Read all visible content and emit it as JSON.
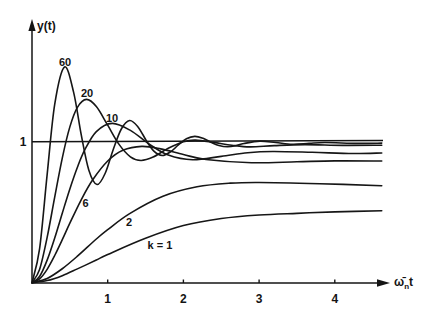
{
  "figure": {
    "y_axis_label": "y(t)",
    "x_axis_label": {
      "base": "ω̄",
      "sub": "n",
      "tail": "t"
    },
    "reference_label": "1"
  },
  "chart_data": {
    "type": "line",
    "title": "",
    "xlabel": "ω̄ₙt",
    "ylabel": "y(t)",
    "x_ticks": [
      "1",
      "2",
      "3",
      "4"
    ],
    "y_ticks": [
      "1"
    ],
    "xlim": [
      0,
      4.7
    ],
    "ylim": [
      0,
      1.86
    ],
    "grid": false,
    "legend": "inline curve labels",
    "reference_lines": [
      {
        "y": 1,
        "label": "1"
      }
    ],
    "series": [
      {
        "name": "k=60",
        "label": "60",
        "points": [
          [
            0,
            0
          ],
          [
            0.1,
            0.24
          ],
          [
            0.2,
            0.766
          ],
          [
            0.3,
            1.265
          ],
          [
            0.43,
            1.53
          ],
          [
            0.55,
            1.35
          ],
          [
            0.65,
            1.05
          ],
          [
            0.75,
            0.8
          ],
          [
            0.86,
            0.696
          ],
          [
            0.97,
            0.78
          ],
          [
            1.07,
            0.94
          ],
          [
            1.18,
            1.09
          ],
          [
            1.29,
            1.15
          ],
          [
            1.4,
            1.105
          ],
          [
            1.51,
            1.008
          ],
          [
            1.61,
            0.933
          ],
          [
            1.72,
            0.902
          ],
          [
            1.83,
            0.928
          ],
          [
            1.93,
            0.975
          ],
          [
            2.04,
            1.021
          ],
          [
            2.15,
            1.038
          ],
          [
            2.26,
            1.024
          ],
          [
            2.37,
            0.995
          ],
          [
            2.47,
            0.973
          ],
          [
            2.58,
            0.964
          ],
          [
            2.69,
            0.971
          ],
          [
            2.8,
            0.987
          ],
          [
            3.01,
            1.004
          ],
          [
            3.22,
            0.994
          ],
          [
            3.44,
            0.982
          ],
          [
            3.66,
            0.988
          ],
          [
            3.87,
            0.994
          ],
          [
            4.3,
            0.988
          ],
          [
            4.62,
            0.99
          ]
        ]
      },
      {
        "name": "k=20",
        "label": "20",
        "points": [
          [
            0,
            0
          ],
          [
            0.1,
            0.094
          ],
          [
            0.2,
            0.321
          ],
          [
            0.3,
            0.607
          ],
          [
            0.4,
            0.884
          ],
          [
            0.5,
            1.105
          ],
          [
            0.6,
            1.244
          ],
          [
            0.72,
            1.3
          ],
          [
            0.85,
            1.249
          ],
          [
            1.0,
            1.117
          ],
          [
            1.15,
            0.981
          ],
          [
            1.3,
            0.893
          ],
          [
            1.44,
            0.867
          ],
          [
            1.6,
            0.891
          ],
          [
            1.8,
            0.953
          ],
          [
            2.0,
            1.0
          ],
          [
            2.16,
            1.011
          ],
          [
            2.4,
            0.995
          ],
          [
            2.64,
            0.975
          ],
          [
            2.88,
            0.963
          ],
          [
            3.2,
            0.972
          ],
          [
            3.6,
            0.979
          ],
          [
            4.1,
            0.974
          ],
          [
            4.62,
            0.975
          ]
        ]
      },
      {
        "name": "k=10",
        "label": "10",
        "points": [
          [
            0,
            0
          ],
          [
            0.1,
            0.044
          ],
          [
            0.2,
            0.16
          ],
          [
            0.3,
            0.317
          ],
          [
            0.4,
            0.493
          ],
          [
            0.5,
            0.665
          ],
          [
            0.6,
            0.819
          ],
          [
            0.7,
            0.945
          ],
          [
            0.85,
            1.072
          ],
          [
            1.06,
            1.13
          ],
          [
            1.3,
            1.08
          ],
          [
            1.55,
            0.982
          ],
          [
            1.8,
            0.905
          ],
          [
            2.12,
            0.872
          ],
          [
            2.5,
            0.896
          ],
          [
            2.85,
            0.922
          ],
          [
            3.18,
            0.931
          ],
          [
            3.7,
            0.925
          ],
          [
            4.24,
            0.916
          ],
          [
            4.62,
            0.92
          ]
        ]
      },
      {
        "name": "k=6",
        "label": "6",
        "points": [
          [
            0,
            0
          ],
          [
            0.1,
            0.027
          ],
          [
            0.2,
            0.095
          ],
          [
            0.3,
            0.193
          ],
          [
            0.4,
            0.305
          ],
          [
            0.5,
            0.422
          ],
          [
            0.65,
            0.588
          ],
          [
            0.8,
            0.728
          ],
          [
            1.0,
            0.863
          ],
          [
            1.2,
            0.939
          ],
          [
            1.45,
            0.967
          ],
          [
            1.7,
            0.949
          ],
          [
            2.0,
            0.909
          ],
          [
            2.3,
            0.874
          ],
          [
            2.9,
            0.851
          ],
          [
            3.5,
            0.858
          ],
          [
            4.0,
            0.864
          ],
          [
            4.62,
            0.863
          ]
        ]
      },
      {
        "name": "k=2",
        "label": "2",
        "points": [
          [
            0,
            0
          ],
          [
            0.2,
            0.03
          ],
          [
            0.4,
            0.099
          ],
          [
            0.6,
            0.188
          ],
          [
            0.85,
            0.31
          ],
          [
            1.0,
            0.376
          ],
          [
            1.29,
            0.49
          ],
          [
            1.73,
            0.613
          ],
          [
            2.18,
            0.68
          ],
          [
            2.62,
            0.706
          ],
          [
            3.0,
            0.711
          ],
          [
            3.8,
            0.702
          ],
          [
            4.62,
            0.688
          ]
        ]
      },
      {
        "name": "k=1",
        "label": "k = 1",
        "points": [
          [
            0,
            0
          ],
          [
            0.2,
            0.015
          ],
          [
            0.4,
            0.05
          ],
          [
            0.6,
            0.098
          ],
          [
            0.85,
            0.161
          ],
          [
            1.0,
            0.2
          ],
          [
            1.5,
            0.315
          ],
          [
            2.0,
            0.405
          ],
          [
            2.5,
            0.455
          ],
          [
            3.0,
            0.48
          ],
          [
            3.5,
            0.492
          ],
          [
            4.0,
            0.502
          ],
          [
            4.62,
            0.51
          ]
        ]
      }
    ]
  }
}
